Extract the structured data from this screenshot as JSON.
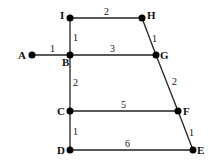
{
  "diagram": {
    "type": "weighted-graph",
    "nodes": [
      {
        "id": "A",
        "label": "A",
        "x": 32,
        "y": 55
      },
      {
        "id": "B",
        "label": "B",
        "x": 70,
        "y": 55
      },
      {
        "id": "C",
        "label": "C",
        "x": 70,
        "y": 111
      },
      {
        "id": "D",
        "label": "D",
        "x": 70,
        "y": 150
      },
      {
        "id": "E",
        "label": "E",
        "x": 193,
        "y": 150
      },
      {
        "id": "F",
        "label": "F",
        "x": 178,
        "y": 111
      },
      {
        "id": "G",
        "label": "G",
        "x": 156,
        "y": 55
      },
      {
        "id": "H",
        "label": "H",
        "x": 142,
        "y": 18
      },
      {
        "id": "I",
        "label": "I",
        "x": 70,
        "y": 18
      }
    ],
    "edges": [
      {
        "from": "A",
        "to": "B",
        "weight": "1"
      },
      {
        "from": "I",
        "to": "B",
        "weight": "1"
      },
      {
        "from": "I",
        "to": "H",
        "weight": "2"
      },
      {
        "from": "H",
        "to": "G",
        "weight": "1"
      },
      {
        "from": "B",
        "to": "G",
        "weight": "3"
      },
      {
        "from": "B",
        "to": "C",
        "weight": "2"
      },
      {
        "from": "G",
        "to": "F",
        "weight": "2"
      },
      {
        "from": "C",
        "to": "F",
        "weight": "5"
      },
      {
        "from": "C",
        "to": "D",
        "weight": "1"
      },
      {
        "from": "F",
        "to": "E",
        "weight": "1"
      },
      {
        "from": "D",
        "to": "E",
        "weight": "6"
      }
    ]
  }
}
